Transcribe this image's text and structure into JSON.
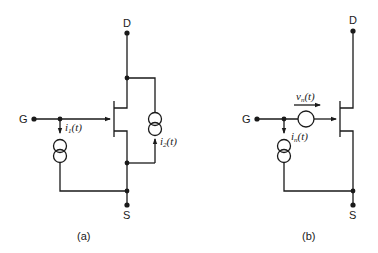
{
  "figure": {
    "panels": [
      {
        "id": "a",
        "caption": "(a)",
        "terminals": {
          "gate": "G",
          "drain": "D",
          "source": "S"
        },
        "sources": [
          {
            "type": "current-source",
            "label": "i",
            "subscript": "1",
            "arg": "(t)",
            "position": "gate-to-source"
          },
          {
            "type": "current-source",
            "label": "i",
            "subscript": "2",
            "arg": "(t)",
            "position": "drain-to-source"
          }
        ]
      },
      {
        "id": "b",
        "caption": "(b)",
        "terminals": {
          "gate": "G",
          "drain": "D",
          "source": "S"
        },
        "sources": [
          {
            "type": "voltage-source",
            "label": "v",
            "subscript": "n",
            "arg": "(t)",
            "position": "series-gate"
          },
          {
            "type": "current-source",
            "label": "i",
            "subscript": "n",
            "arg": "(t)",
            "position": "gate-to-source"
          }
        ]
      }
    ]
  }
}
